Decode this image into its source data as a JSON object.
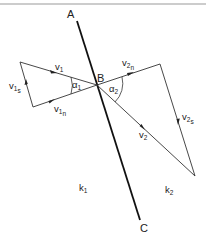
{
  "diagram": {
    "line_points": {
      "top": "A",
      "middle": "B",
      "bottom": "C"
    },
    "regions": {
      "left": {
        "base": "k",
        "sub": "1"
      },
      "right": {
        "base": "k",
        "sub": "2"
      }
    },
    "left_triangle": {
      "v1": {
        "base": "v",
        "sub": "1"
      },
      "v1s": {
        "base": "v",
        "sub": "1",
        "subsub": "s"
      },
      "v1n": {
        "base": "v",
        "sub": "1",
        "subsub": "n"
      },
      "angle": {
        "base": "α",
        "sub": "1"
      }
    },
    "right_triangle": {
      "v2": {
        "base": "v",
        "sub": "2"
      },
      "v2s": {
        "base": "v",
        "sub": "2",
        "subsub": "s"
      },
      "v2n": {
        "base": "v",
        "sub": "2",
        "subsub": "n"
      },
      "angle": {
        "base": "α",
        "sub": "2"
      }
    },
    "colors": {
      "line": "#111111",
      "vector": "#333333",
      "border": "#9a9a9a"
    }
  }
}
